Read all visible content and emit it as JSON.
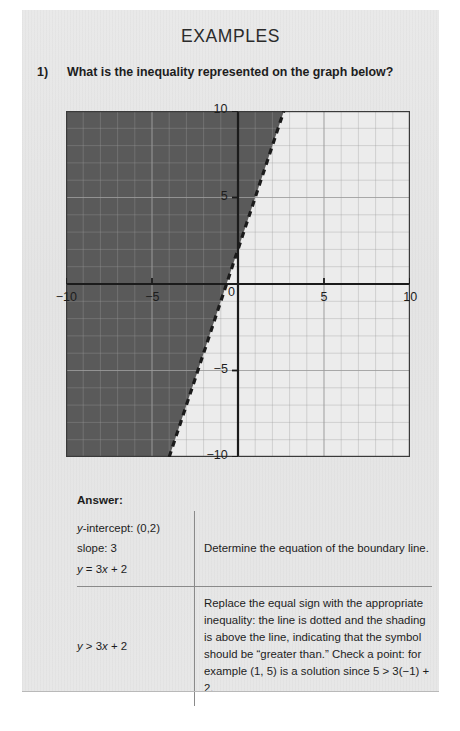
{
  "page": {
    "title": "EXAMPLES",
    "background_color": "#e6e6e6"
  },
  "question": {
    "number": "1)",
    "text": "What is the inequality represented on the graph below?"
  },
  "answer": {
    "label": "Answer:",
    "rows": [
      {
        "left_lines": [
          "y-intercept: (0,2)",
          "slope: 3",
          "y = 3x + 2"
        ],
        "right": "Determine the equation of the boundary line."
      },
      {
        "left_lines": [
          "y > 3x + 2"
        ],
        "right": "Replace the equal sign with the appropriate inequality: the line is dotted and the shading is above the line, indicating that the symbol should be “greater than.” Check a point: for example (1, 5) is a solution since 5 > 3(−1) + 2."
      }
    ]
  },
  "chart_data": {
    "type": "line",
    "title": "",
    "xlabel": "",
    "ylabel": "",
    "xlim": [
      -10,
      10
    ],
    "ylim": [
      -10,
      10
    ],
    "grid": true,
    "grid_step": 1,
    "major_step": 5,
    "x_ticks": [
      -10,
      -5,
      0,
      5,
      10
    ],
    "y_ticks": [
      -10,
      -5,
      0,
      5,
      10
    ],
    "x_tick_labels": [
      "−10",
      "−5",
      "0",
      "5",
      "10"
    ],
    "y_tick_labels": [
      "−10",
      "−5",
      "0",
      "5",
      "10"
    ],
    "boundary_line": {
      "equation": "y = 3x + 2",
      "slope": 3,
      "intercept": 2,
      "style": "dashed",
      "color": "#1b1b1b"
    },
    "inequality": "y > 3x + 2",
    "shaded_region": "above-left",
    "shade_color": "#5a5a5a",
    "plot_background": "#ececec",
    "grid_color": "#9c9c9c",
    "axis_color": "#1b1b1b"
  },
  "colors": {
    "text": "#1d1d1d",
    "page_bg": "#e6e6e6",
    "rule": "#8a8a8a"
  }
}
